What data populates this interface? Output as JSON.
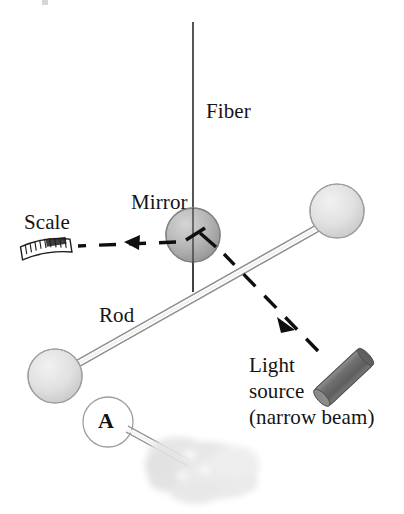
{
  "figure": {
    "background_color": "#ffffff"
  },
  "labels": {
    "fiber": "Fiber",
    "mirror": "Mirror",
    "scale": "Scale",
    "rod": "Rod",
    "light": "Light",
    "source": "source",
    "narrow_beam": "(narrow beam)",
    "sphere_a": "A"
  },
  "colors": {
    "ink": "#141414",
    "sphere_light_fill": "#e2e2e2",
    "sphere_light_edge": "#9a9a9a",
    "mirror_fill": "#b5b5b5",
    "mirror_edge": "#7d7d7d",
    "light_source_fill": "#6e6e6e",
    "light_source_edge": "#3c3c3c",
    "rod_stroke": "#8a8a8a",
    "fiber_stroke": "#2a2a2a",
    "beam_stroke": "#0f0f0f",
    "hand_fill": "#dcdcdc",
    "white": "#ffffff"
  },
  "elements": {
    "fiber_line": {
      "x": 193,
      "y_top": 22,
      "y_bottom": 292
    },
    "mirror_sphere": {
      "cx": 193,
      "cy": 235,
      "r": 27
    },
    "top_right_sphere": {
      "cx": 337,
      "cy": 211,
      "r": 27
    },
    "bottom_left_sphere": {
      "cx": 55,
      "cy": 376,
      "r": 27
    },
    "sphere_a": {
      "cx": 108,
      "cy": 422,
      "r": 25
    },
    "rod": {
      "x1": 74,
      "y1": 361,
      "x2": 316,
      "y2": 225
    },
    "light_source_cylinder": {
      "x1": 322,
      "y1": 357,
      "x2": 364,
      "y2": 398
    },
    "reflected_beam": {
      "from_x": 191,
      "from_y": 238,
      "to_x": 77,
      "to_y": 246
    },
    "incident_beam": {
      "from_x": 317,
      "from_y": 350,
      "to_x": 196,
      "to_y": 234
    },
    "scale_ruler": {
      "cx": 46,
      "cy": 248,
      "width": 50,
      "height": 16,
      "ticks": 9
    },
    "hand": {
      "cx": 203,
      "cy": 470,
      "rx": 58,
      "ry": 27
    },
    "hand_rod": {
      "x1": 128,
      "y1": 429,
      "x2": 186,
      "y2": 463
    }
  }
}
